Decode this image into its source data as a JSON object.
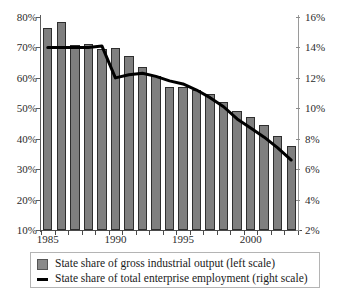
{
  "chart_data": {
    "type": "bar",
    "title": "",
    "subtitle": "",
    "xlabel": "",
    "ylabel": "",
    "grid": false,
    "legend_position": "bottom",
    "x": [
      1985,
      1986,
      1987,
      1988,
      1989,
      1990,
      1991,
      1992,
      1993,
      1994,
      1995,
      1996,
      1997,
      1998,
      1999,
      2000,
      2001,
      2002,
      2003
    ],
    "categories": [
      "1985",
      "1986",
      "1987",
      "1988",
      "1989",
      "1990",
      "1991",
      "1992",
      "1993",
      "1994",
      "1995",
      "1996",
      "1997",
      "1998",
      "1999",
      "2000",
      "2001",
      "2002",
      "2003"
    ],
    "axes": {
      "left": {
        "label": "",
        "ylim": [
          10,
          80
        ],
        "ticks": [
          10,
          20,
          30,
          40,
          50,
          60,
          70,
          80
        ],
        "ticklabels": [
          "10%",
          "20%",
          "30%",
          "40%",
          "50%",
          "60%",
          "70%",
          "80%"
        ]
      },
      "right": {
        "label": "",
        "ylim": [
          2,
          16
        ],
        "ticks": [
          2,
          4,
          6,
          8,
          10,
          12,
          14,
          16
        ],
        "ticklabels": [
          "2%",
          "4%",
          "6%",
          "8%",
          "10%",
          "12%",
          "14%",
          "16%"
        ]
      },
      "x": {
        "ticklabels": [
          "1985",
          "1990",
          "1995",
          "2000"
        ],
        "tickvalues": [
          1985,
          1990,
          1995,
          2000
        ]
      }
    },
    "series": [
      {
        "name": "State share of gross industrial output (left scale)",
        "type": "bar",
        "axis": "left",
        "color": "#7f7f7f",
        "edgecolor": "#2e2e2e",
        "values": [
          76.5,
          78.3,
          70.8,
          71.1,
          69.5,
          69.8,
          67.3,
          63.7,
          60.6,
          57.1,
          57.0,
          56.1,
          54.6,
          52.1,
          49.2,
          47.3,
          44.4,
          40.8,
          37.5
        ]
      },
      {
        "name": "State share of total enterprise employment (right scale)",
        "type": "line",
        "axis": "right",
        "color": "#000000",
        "values": [
          14.0,
          14.0,
          14.0,
          14.0,
          14.1,
          12.0,
          12.2,
          12.3,
          12.1,
          11.8,
          11.6,
          11.2,
          10.7,
          10.1,
          9.3,
          8.7,
          8.1,
          7.4,
          6.6
        ]
      }
    ]
  },
  "legend": {
    "items": [
      {
        "marker": "box-swatch",
        "label": "State share of gross industrial output (left scale)"
      },
      {
        "marker": "line-swatch",
        "label": "State share of total enterprise employment (right scale)"
      }
    ]
  },
  "colors": {
    "bar_fill": "#7f7f7f",
    "bar_edge": "#2e2e2e",
    "line": "#000000",
    "axis_left": "#5c5c5c",
    "axis_right": "#9a9a9a",
    "text": "#2b2b2b",
    "background": "#ffffff"
  }
}
